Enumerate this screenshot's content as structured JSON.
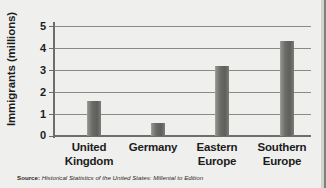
{
  "chart_data": {
    "type": "bar",
    "title": "",
    "xlabel": "",
    "ylabel": "Immigrants (millions)",
    "categories": [
      "United Kingdom",
      "Germany",
      "Eastern Europe",
      "Southern Europe"
    ],
    "category_lines": [
      [
        "United",
        "Kingdom"
      ],
      [
        "Germany"
      ],
      [
        "Eastern",
        "Europe"
      ],
      [
        "Southern",
        "Europe"
      ]
    ],
    "values": [
      1.6,
      0.6,
      3.2,
      4.3
    ],
    "ylim": [
      0,
      5
    ],
    "yticks": [
      0,
      1,
      2,
      3,
      4,
      5
    ],
    "ytick_labels": [
      "0",
      "1",
      "2",
      "3",
      "4",
      "5"
    ],
    "grid": true,
    "legend": false,
    "bar_color": "#6a6a67",
    "background_color": "#efefed",
    "axis_color": "#6d6d6a"
  },
  "source_note": {
    "prefix": "Source:",
    "text": "Historical Statistics of the United States: Millenial to Edition"
  }
}
